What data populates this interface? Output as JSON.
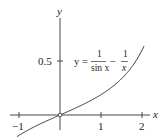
{
  "chart_data": {
    "type": "line",
    "title": "",
    "xlabel": "x",
    "ylabel": "y",
    "xlim": [
      -1.15,
      2.25
    ],
    "ylim": [
      -0.22,
      1.0
    ],
    "x_ticks": [
      -1,
      1,
      2
    ],
    "x_tick_labels": [
      "−1",
      "1",
      "2"
    ],
    "y_ticks": [
      0.5
    ],
    "y_tick_labels": [
      "0.5"
    ],
    "grid": false,
    "legend": null,
    "annotation": {
      "lhs": "y =",
      "frac1_num": "1",
      "frac1_den": "sin x",
      "minus": "−",
      "frac2_num": "1",
      "frac2_den": "x"
    },
    "series": [
      {
        "name": "y = 1/sin x − 1/x",
        "function": "1/sin(x) - 1/x",
        "x": [
          -1.0,
          -0.75,
          -0.5,
          -0.25,
          0.0,
          0.25,
          0.5,
          0.75,
          1.0,
          1.25,
          1.5,
          1.75,
          2.0
        ],
        "values": [
          -0.188,
          -0.134,
          -0.086,
          -0.042,
          0.0,
          0.042,
          0.086,
          0.134,
          0.188,
          0.253,
          0.336,
          0.446,
          0.6
        ]
      }
    ],
    "special_points": [
      {
        "x": 0,
        "y": 0,
        "marker": "open-circle"
      }
    ]
  }
}
